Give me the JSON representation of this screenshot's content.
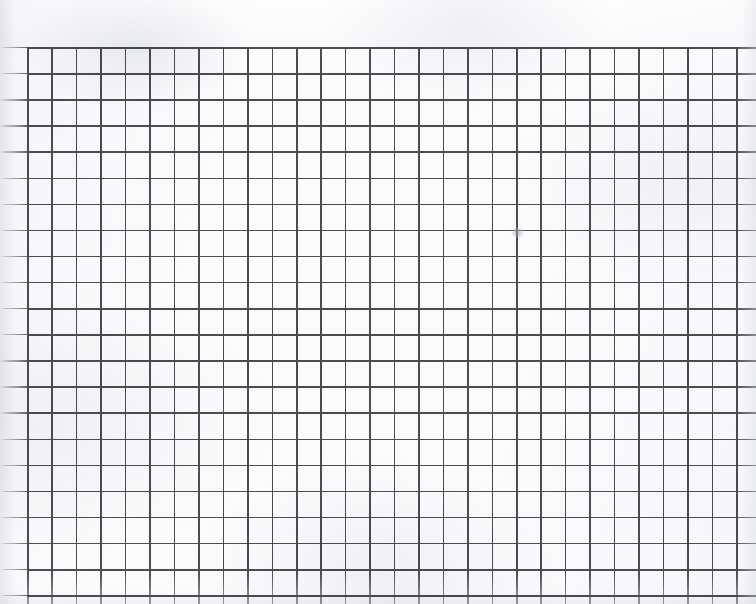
{
  "document": {
    "kind": "scanned-graph-paper",
    "title": "Blank Graph Paper Scan",
    "width_px": 756,
    "height_px": 604,
    "paper_color": "#fbfbfc",
    "rule_color": "#4b4b53",
    "has_text": false,
    "has_handwriting": false
  },
  "margins": {
    "top_band_height_px": 47,
    "left_band_width_px": 27,
    "top_band_label": "unruled top margin",
    "left_band_label": "left margin with faded rule stubs"
  },
  "grid": {
    "origin_x_px": 27,
    "origin_y_px": 47,
    "column_spacing_px": 24.45,
    "row_spacing_px": 26.1,
    "column_count": 30,
    "row_count": 21,
    "line_width_px": 1.6,
    "orientation": "landscape",
    "cropped_edges": [
      "right",
      "bottom"
    ]
  },
  "marks": [
    {
      "name": "pencil-smudge",
      "kind": "faint graphite smudge",
      "x_px": 517,
      "y_px": 232,
      "width_px": 13,
      "height_px": 11,
      "color": "#96989e"
    }
  ]
}
